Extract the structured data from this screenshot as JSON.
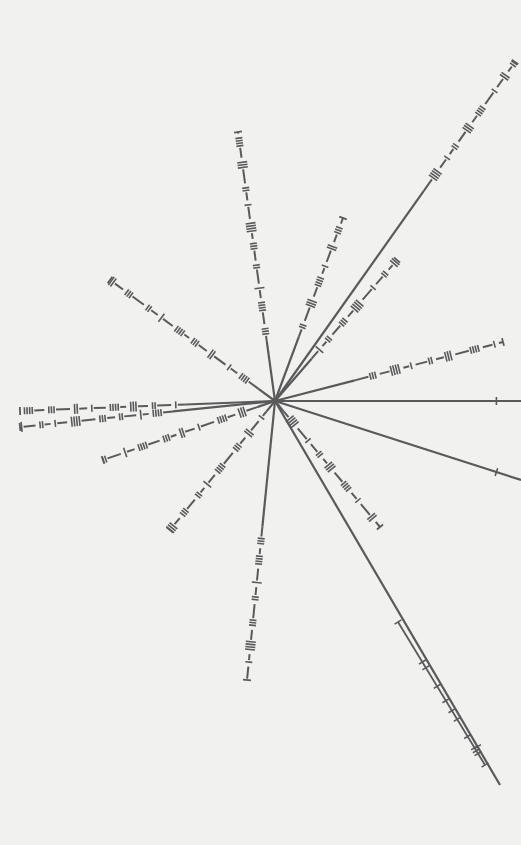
{
  "title": "Pulsar map",
  "colors": {
    "background": "#f1f1f0",
    "line": "#5a5a5a"
  },
  "center": {
    "x": 275,
    "y": 401
  },
  "lines": [
    {
      "id": "L1",
      "end": [
        515,
        62
      ],
      "dash_start": 0.62
    },
    {
      "id": "L2",
      "end": [
        238,
        132
      ],
      "dash_start": 0.22
    },
    {
      "id": "L3",
      "end": [
        343,
        218
      ],
      "dash_start": 0.35
    },
    {
      "id": "L4",
      "end": [
        397,
        260
      ],
      "dash_start": 0.3
    },
    {
      "id": "L5",
      "end": [
        110,
        280
      ],
      "dash_start": 0.1
    },
    {
      "id": "L6",
      "end": [
        503,
        342
      ],
      "dash_start": 0.35
    },
    {
      "id": "L7",
      "end": [
        521,
        401
      ],
      "dash_start": 1.0
    },
    {
      "id": "L8",
      "end": [
        20,
        411
      ],
      "dash_start": 0.35
    },
    {
      "id": "L9",
      "end": [
        20,
        427
      ],
      "dash_start": 0.4
    },
    {
      "id": "L10",
      "end": [
        103,
        460
      ],
      "dash_start": 0.1
    },
    {
      "id": "L11",
      "end": [
        521,
        480
      ],
      "dash_start": 1.0
    },
    {
      "id": "L12",
      "end": [
        170,
        530
      ],
      "dash_start": 0.08
    },
    {
      "id": "L13",
      "end": [
        380,
        527
      ],
      "dash_start": 0.08
    },
    {
      "id": "L14",
      "end": [
        247,
        680
      ],
      "dash_start": 0.45
    },
    {
      "id": "L15",
      "end": [
        500,
        785
      ],
      "dash_start": 1.0
    }
  ],
  "parallel_segment": {
    "from": [
      398,
      622
    ],
    "to": [
      485,
      765
    ]
  }
}
